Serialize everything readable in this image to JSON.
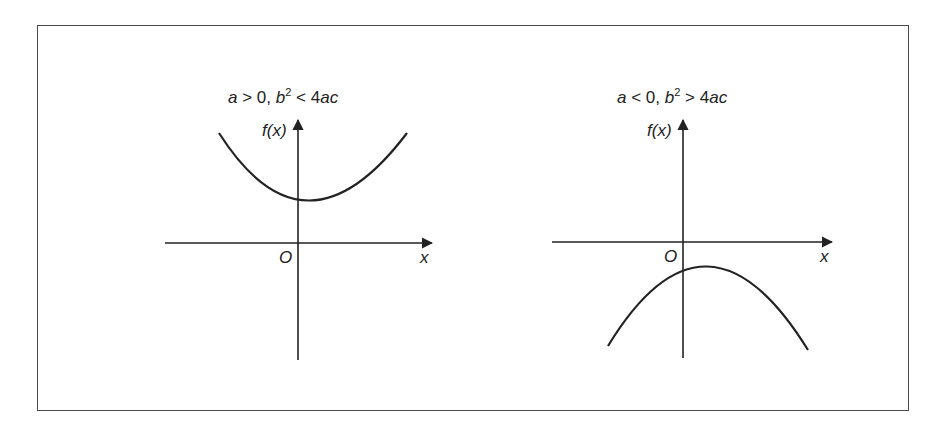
{
  "figure": {
    "panels": [
      {
        "title_parts": {
          "a": "a",
          "rel1": " > 0, ",
          "b": "b",
          "sup": "2",
          "rel2": " < 4",
          "ac": "ac"
        },
        "title": "a > 0, b² < 4ac",
        "y_axis_label": "f(x)",
        "x_axis_label": "x",
        "origin_label": "O",
        "curve": "upward parabola, entirely above x-axis"
      },
      {
        "title_parts": {
          "a": "a",
          "rel1": " < 0, ",
          "b": "b",
          "sup": "2",
          "rel2": " > 4",
          "ac": "ac"
        },
        "title": "a < 0, b² > 4ac",
        "y_axis_label": "f(x)",
        "x_axis_label": "x",
        "origin_label": "O",
        "curve": "downward parabola, entirely below x-axis"
      }
    ],
    "colors": {
      "ink": "#222222",
      "frame": "#4a4a4a",
      "background": "#ffffff"
    }
  }
}
